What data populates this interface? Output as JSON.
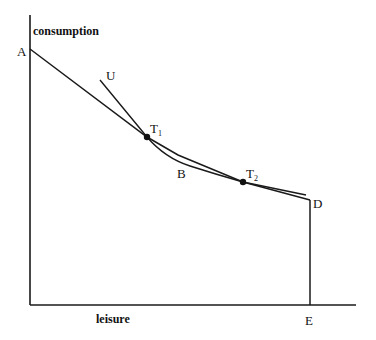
{
  "diagram": {
    "axes": {
      "y_label": "consumption",
      "x_label": "leisure"
    },
    "points": {
      "A": "A",
      "B": "B",
      "D": "D",
      "E": "E",
      "U": "U",
      "T1": "T",
      "T1_sub": "1",
      "T2": "T",
      "T2_sub": "2"
    },
    "colors": {
      "line": "#1a1a1a",
      "background": "#ffffff"
    }
  }
}
